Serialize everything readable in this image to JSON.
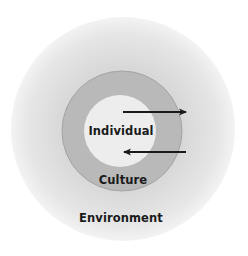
{
  "diagram": {
    "type": "nested-circles",
    "layers": [
      {
        "id": "environment",
        "label": "Environment",
        "color_center": "#d4d4d4",
        "color_edge": "#f2f2f2"
      },
      {
        "id": "culture",
        "label": "Culture",
        "color": "#b9b9b9",
        "stroke": "#9a9a9a"
      },
      {
        "id": "individual",
        "label": "Individual",
        "color": "#ededed"
      }
    ],
    "arrows": [
      {
        "id": "outward-arrow",
        "direction": "right",
        "from": "individual",
        "to": "environment"
      },
      {
        "id": "inward-arrow",
        "direction": "left",
        "from": "environment",
        "to": "individual"
      }
    ],
    "arrow_color": "#1a1a1a"
  }
}
